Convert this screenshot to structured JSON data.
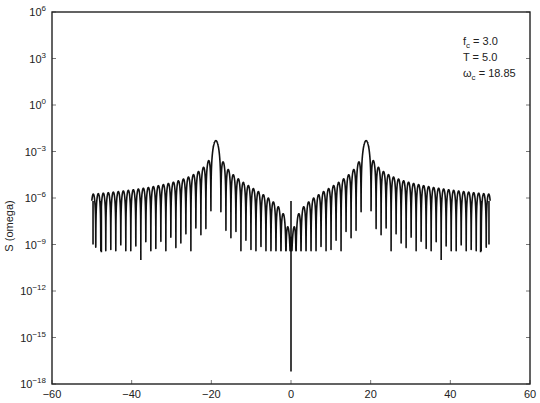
{
  "chart_data": {
    "type": "line",
    "title": "",
    "xlabel": "",
    "ylabel": "S (omega)",
    "xlim": [
      -60,
      60
    ],
    "ylim_log10": [
      -18,
      6
    ],
    "yscale": "log",
    "grid": false,
    "x_ticks": [
      -60,
      -40,
      -20,
      0,
      20,
      40,
      60
    ],
    "x_tick_labels": [
      "−60",
      "−40",
      "−20",
      "0",
      "20",
      "40",
      "60"
    ],
    "y_ticks": [
      {
        "base": "10",
        "exp": "6"
      },
      {
        "base": "10",
        "exp": "3"
      },
      {
        "base": "10",
        "exp": "0"
      },
      {
        "base": "10",
        "exp": "−3"
      },
      {
        "base": "10",
        "exp": "−6"
      },
      {
        "base": "10",
        "exp": "−9"
      },
      {
        "base": "10",
        "exp": "−12"
      },
      {
        "base": "10",
        "exp": "−15"
      },
      {
        "base": "10",
        "exp": "−18"
      }
    ],
    "y_tick_values_log10": [
      6,
      3,
      0,
      -3,
      -6,
      -9,
      -12,
      -15,
      -18
    ],
    "annotations": [
      {
        "main": "f",
        "sub": "c",
        "rest": " = 3.0"
      },
      {
        "main": "T",
        "sub": "",
        "rest": " = 5.0"
      },
      {
        "main": "ω",
        "sub": "c",
        "rest": " = 18.85"
      }
    ],
    "parameters": {
      "fc": 3.0,
      "T": 5.0,
      "omega_c": 18.85
    },
    "series": [
      {
        "name": "S(omega)",
        "x_range": [
          -50,
          50
        ],
        "peaks": [
          {
            "x": -18.85,
            "y_log10": -2.3
          },
          {
            "x": 18.85,
            "y_log10": -2.3
          }
        ],
        "sidelobe_floor_log10_at_edges": -5.6,
        "sidelobe_floor_log10_near_center": -5.2,
        "deep_nulls": [
          {
            "x": 0,
            "y_log10": -17.2
          },
          {
            "x": -37.7,
            "y_log10": -10
          },
          {
            "x": 37.7,
            "y_log10": -10
          },
          {
            "x": -47.6,
            "y_log10": -9.5
          },
          {
            "x": 47.6,
            "y_log10": -9.5
          },
          {
            "x": -49.7,
            "y_log10": -9
          },
          {
            "x": 49.7,
            "y_log10": -9
          }
        ],
        "color": "#111111"
      }
    ]
  }
}
